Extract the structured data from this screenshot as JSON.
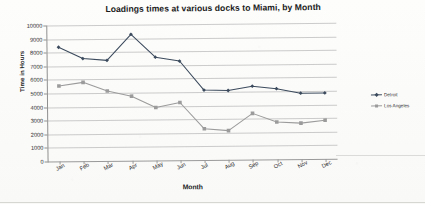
{
  "chart_data": {
    "type": "line",
    "title": "Loadings times at various docks to Miami, by Month",
    "xlabel": "Month",
    "ylabel": "Time in Hours",
    "categories": [
      "Jan",
      "Feb",
      "Mar",
      "Apr",
      "May",
      "Jun",
      "Jul",
      "Aug",
      "Sep",
      "Oct",
      "Nov",
      "Dec"
    ],
    "ylim": [
      0,
      10000
    ],
    "ytick_step": 1000,
    "ytick_labels": [
      "10000",
      "9000",
      "8000",
      "7000",
      "6000",
      "5000",
      "4000",
      "3000",
      "2000",
      "1000",
      "0"
    ],
    "grid": true,
    "legend_position": "right",
    "series": [
      {
        "name": "Detroit",
        "color": "#3b4a5c",
        "marker": "diamond",
        "values": [
          8400,
          7550,
          7400,
          9300,
          7600,
          7300,
          5150,
          5100,
          5400,
          5200,
          4850,
          4850
        ]
      },
      {
        "name": "Los Angeles",
        "color": "#9b9b9b",
        "marker": "square",
        "values": [
          5550,
          5800,
          5150,
          4750,
          3900,
          4250,
          2300,
          2150,
          3400,
          2750,
          2650,
          2850
        ]
      }
    ]
  }
}
